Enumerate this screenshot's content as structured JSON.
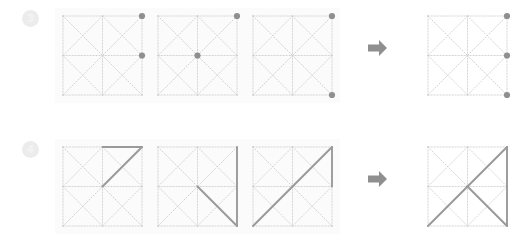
{
  "page": {
    "background": "#ffffff",
    "panel_background": "#fbfbfb",
    "grid_line_color": "#cfcfcf",
    "solid_line_color": "#9a9a9a",
    "dot_color": "#8f8f8f",
    "badge_background": "#ececec",
    "badge_text_color": "#f4f4f4",
    "arrow_color": "#8f8f8f",
    "width": 532,
    "height": 245
  },
  "rows": [
    {
      "id": "row-3",
      "badge_label": "3",
      "arrow_icon": "arrow-right-icon",
      "panels": [
        {
          "name": "panel-3-1",
          "role": "input",
          "dots": [
            {
              "x": 2,
              "y": 0,
              "label": "top-right"
            },
            {
              "x": 2,
              "y": 1,
              "label": "middle-right"
            }
          ],
          "solid_lines": []
        },
        {
          "name": "panel-3-2",
          "role": "input",
          "dots": [
            {
              "x": 2,
              "y": 0,
              "label": "top-right"
            },
            {
              "x": 1,
              "y": 1,
              "label": "center"
            }
          ],
          "solid_lines": []
        },
        {
          "name": "panel-3-3",
          "role": "input",
          "dots": [
            {
              "x": 2,
              "y": 0,
              "label": "top-right"
            },
            {
              "x": 2,
              "y": 2,
              "label": "bottom-right"
            }
          ],
          "solid_lines": []
        },
        {
          "name": "panel-3-result",
          "role": "result",
          "dots": [
            {
              "x": 2,
              "y": 0,
              "label": "top-right"
            },
            {
              "x": 2,
              "y": 1,
              "label": "middle-right"
            },
            {
              "x": 2,
              "y": 2,
              "label": "bottom-right"
            }
          ],
          "solid_lines": []
        }
      ]
    },
    {
      "id": "row-4",
      "badge_label": "4",
      "arrow_icon": "arrow-right-icon",
      "panels": [
        {
          "name": "panel-4-1",
          "role": "input",
          "dots": [],
          "solid_lines": [
            {
              "x1": 1,
              "y1": 0,
              "x2": 2,
              "y2": 0,
              "label": "top-edge-right-half"
            },
            {
              "x1": 1,
              "y1": 1,
              "x2": 2,
              "y2": 0,
              "label": "center-to-top-right"
            }
          ]
        },
        {
          "name": "panel-4-2",
          "role": "input",
          "dots": [],
          "solid_lines": [
            {
              "x1": 2,
              "y1": 0,
              "x2": 2,
              "y2": 2,
              "label": "right-edge"
            },
            {
              "x1": 1,
              "y1": 1,
              "x2": 2,
              "y2": 2,
              "label": "center-to-bottom-right"
            }
          ]
        },
        {
          "name": "panel-4-3",
          "role": "input",
          "dots": [],
          "solid_lines": [
            {
              "x1": 0,
              "y1": 2,
              "x2": 2,
              "y2": 0,
              "label": "full-diagonal-bottom-left-to-top-right"
            },
            {
              "x1": 2,
              "y1": 0,
              "x2": 2,
              "y2": 1,
              "label": "right-edge-top-half"
            }
          ]
        },
        {
          "name": "panel-4-result",
          "role": "result",
          "dots": [],
          "solid_lines": [
            {
              "x1": 0,
              "y1": 2,
              "x2": 2,
              "y2": 0,
              "label": "full-diagonal-bottom-left-to-top-right"
            },
            {
              "x1": 1,
              "y1": 1,
              "x2": 2,
              "y2": 2,
              "label": "center-to-bottom-right"
            },
            {
              "x1": 2,
              "y1": 0,
              "x2": 2,
              "y2": 2,
              "label": "right-edge"
            }
          ]
        }
      ]
    }
  ],
  "grid_template": {
    "cells": 2,
    "description": "2x2 dotted grid with both diagonals drawn in every cell",
    "dotted_lines": [
      {
        "x1": 0,
        "y1": 0,
        "x2": 2,
        "y2": 0,
        "label": "top-edge"
      },
      {
        "x1": 0,
        "y1": 1,
        "x2": 2,
        "y2": 1,
        "label": "middle-horizontal"
      },
      {
        "x1": 0,
        "y1": 2,
        "x2": 2,
        "y2": 2,
        "label": "bottom-edge"
      },
      {
        "x1": 0,
        "y1": 0,
        "x2": 0,
        "y2": 2,
        "label": "left-edge"
      },
      {
        "x1": 1,
        "y1": 0,
        "x2": 1,
        "y2": 2,
        "label": "middle-vertical"
      },
      {
        "x1": 2,
        "y1": 0,
        "x2": 2,
        "y2": 2,
        "label": "right-edge"
      },
      {
        "x1": 0,
        "y1": 0,
        "x2": 1,
        "y2": 1,
        "label": "cell-tl-diag-down"
      },
      {
        "x1": 1,
        "y1": 0,
        "x2": 0,
        "y2": 1,
        "label": "cell-tl-diag-up"
      },
      {
        "x1": 1,
        "y1": 0,
        "x2": 2,
        "y2": 1,
        "label": "cell-tr-diag-down"
      },
      {
        "x1": 2,
        "y1": 0,
        "x2": 1,
        "y2": 1,
        "label": "cell-tr-diag-up"
      },
      {
        "x1": 0,
        "y1": 1,
        "x2": 1,
        "y2": 2,
        "label": "cell-bl-diag-down"
      },
      {
        "x1": 1,
        "y1": 1,
        "x2": 0,
        "y2": 2,
        "label": "cell-bl-diag-up"
      },
      {
        "x1": 1,
        "y1": 1,
        "x2": 2,
        "y2": 2,
        "label": "cell-br-diag-down"
      },
      {
        "x1": 2,
        "y1": 1,
        "x2": 1,
        "y2": 2,
        "label": "cell-br-diag-up"
      }
    ],
    "node_dots": [
      {
        "x": 0,
        "y": 0
      },
      {
        "x": 1,
        "y": 0
      },
      {
        "x": 2,
        "y": 0
      },
      {
        "x": 0,
        "y": 1
      },
      {
        "x": 1,
        "y": 1
      },
      {
        "x": 2,
        "y": 1
      },
      {
        "x": 0,
        "y": 2
      },
      {
        "x": 1,
        "y": 2
      },
      {
        "x": 2,
        "y": 2
      }
    ]
  }
}
